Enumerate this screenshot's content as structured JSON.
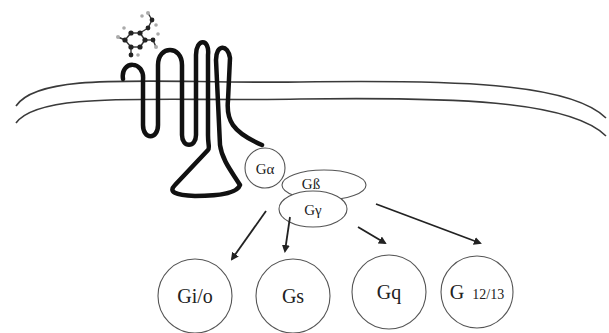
{
  "diagram": {
    "colors": {
      "background": "#ffffff",
      "receptor": "#111111",
      "membrane": "#3a3a3a",
      "subunit_outline": "#555555",
      "arrow": "#222222"
    },
    "ligand": {
      "name": "ligand-molecule"
    },
    "membrane": {
      "name": "plasma-membrane"
    },
    "receptor": {
      "name": "seven-transmembrane-receptor"
    },
    "heterotrimer": {
      "alpha": {
        "label": "Gα"
      },
      "beta": {
        "label": "Gß"
      },
      "gamma": {
        "label": "Gγ"
      }
    },
    "families": [
      {
        "label": "Gi/o"
      },
      {
        "label": "Gs"
      },
      {
        "label": "Gq"
      },
      {
        "label_main": "G",
        "label_sub": "12/13"
      }
    ]
  }
}
